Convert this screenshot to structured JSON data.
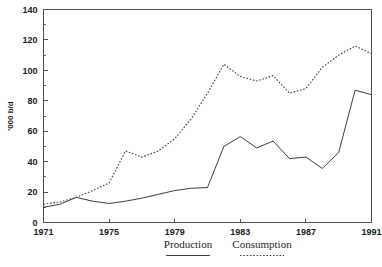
{
  "chart_data": {
    "type": "line",
    "title": "",
    "xlabel": "",
    "ylabel": "'000 b/d",
    "xlim": [
      1971,
      1991
    ],
    "ylim": [
      0,
      140
    ],
    "grid": false,
    "legend_position": "bottom",
    "x": [
      1971,
      1972,
      1973,
      1974,
      1975,
      1976,
      1977,
      1978,
      1979,
      1980,
      1981,
      1982,
      1983,
      1984,
      1985,
      1986,
      1987,
      1988,
      1989,
      1990,
      1991
    ],
    "x_ticks": [
      "1971",
      "1975",
      "1979",
      "1983",
      "1987",
      "1991"
    ],
    "x_tick_values": [
      1971,
      1975,
      1979,
      1983,
      1987,
      1991
    ],
    "y_ticks": [
      "0",
      "20",
      "40",
      "60",
      "80",
      "100",
      "120",
      "140"
    ],
    "y_tick_values": [
      0,
      20,
      40,
      60,
      80,
      100,
      120,
      140
    ],
    "y_minor_values": [
      10,
      30,
      50,
      70,
      90,
      110,
      130
    ],
    "series": [
      {
        "name": "Production",
        "style": "solid",
        "color": "#3c3c3c",
        "values": [
          10,
          12,
          16.5,
          14,
          12.5,
          14,
          16,
          18.5,
          21,
          22.5,
          23,
          50,
          56.5,
          49,
          53.5,
          42,
          43,
          35.5,
          46,
          87,
          84
        ]
      },
      {
        "name": "Consumption",
        "style": "dotted",
        "color": "#3c3c3c",
        "values": [
          12,
          13.5,
          16.5,
          21,
          26,
          47,
          43,
          47,
          55,
          68,
          85,
          104,
          96,
          93,
          96.5,
          85,
          88,
          102,
          110,
          116,
          111
        ]
      }
    ]
  },
  "legend": {
    "items": [
      {
        "label": "Production",
        "style": "solid"
      },
      {
        "label": "Consumption",
        "style": "dotted"
      }
    ]
  }
}
